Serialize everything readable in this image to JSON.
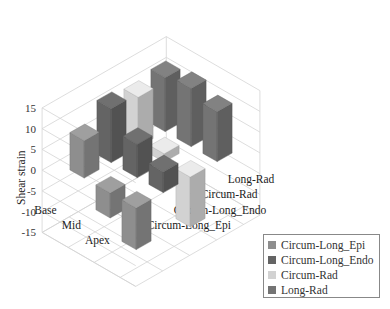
{
  "chart_data": {
    "type": "bar3d",
    "title": "",
    "zlabel": "Shear strain",
    "zlim": [
      -15,
      15
    ],
    "zticks": [
      15,
      10,
      5,
      0,
      -5,
      -10,
      -15
    ],
    "categories": [
      "Base",
      "Mid",
      "Apex"
    ],
    "series": [
      {
        "name": "Circum-Long_Epi",
        "color": "#8e8e8e",
        "values": [
          9,
          -6,
          -10
        ]
      },
      {
        "name": "Circum-Long_Endo",
        "color": "#646464",
        "values": [
          13,
          8,
          5
        ]
      },
      {
        "name": "Circum-Rad",
        "color": "#d2d2d2",
        "values": [
          12,
          2,
          -12
        ]
      },
      {
        "name": "Long-Rad",
        "color": "#747474",
        "values": [
          13,
          14,
          12
        ]
      }
    ],
    "legend_position": "bottom-right",
    "grid": true
  }
}
